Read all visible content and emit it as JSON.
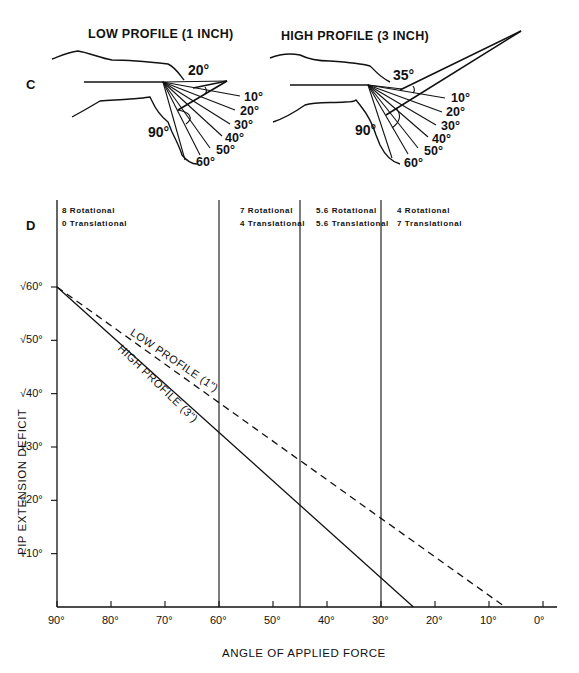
{
  "panel_c": {
    "letter": "C",
    "low": {
      "title": "LOW PROFILE (1 INCH)",
      "top_angle": "20°",
      "side_angle": "90°",
      "fan_labels": [
        "10°",
        "20°",
        "30°",
        "40°",
        "50°",
        "60°"
      ]
    },
    "high": {
      "title": "HIGH PROFILE (3 INCH)",
      "top_angle": "35°",
      "side_angle": "90°",
      "fan_labels": [
        "10°",
        "20°",
        "30°",
        "40°",
        "50°",
        "60°"
      ]
    }
  },
  "panel_d": {
    "letter": "D"
  },
  "chart_data": {
    "type": "line",
    "title": "",
    "xlabel": "ANGLE OF APPLIED FORCE",
    "ylabel": "PIP EXTENSION DEFICIT",
    "xlim": [
      90,
      0
    ],
    "ylim": [
      0,
      60
    ],
    "x_ticks": [
      90,
      80,
      70,
      60,
      50,
      40,
      30,
      20,
      10,
      0
    ],
    "x_tick_labels": [
      "90°",
      "80°",
      "70°",
      "60°",
      "50°",
      "40°",
      "30°",
      "20°",
      "10°",
      "0°"
    ],
    "y_ticks": [
      60,
      50,
      40,
      30,
      20,
      10
    ],
    "y_tick_labels": [
      "√60°",
      "√50°",
      "√40°",
      "√30°",
      "√20°",
      "√10°"
    ],
    "grid": false,
    "series": [
      {
        "name": "LOW PROFILE (1\")",
        "style": "dashed",
        "x": [
          90,
          7
        ],
        "y": [
          60,
          0
        ]
      },
      {
        "name": "HIGH PROFILE (3\")",
        "style": "solid",
        "x": [
          90,
          24
        ],
        "y": [
          60,
          0
        ]
      }
    ],
    "reference_lines_x": [
      90,
      60,
      45,
      30
    ],
    "region_annotations": [
      {
        "line1": "8 Rotational",
        "line2": "0 Translational"
      },
      {
        "line1": "7 Rotational",
        "line2": "4 Translational"
      },
      {
        "line1": "5.6 Rotational",
        "line2": "5.6 Translational"
      },
      {
        "line1": "4 Rotational",
        "line2": "7 Translational"
      }
    ]
  }
}
